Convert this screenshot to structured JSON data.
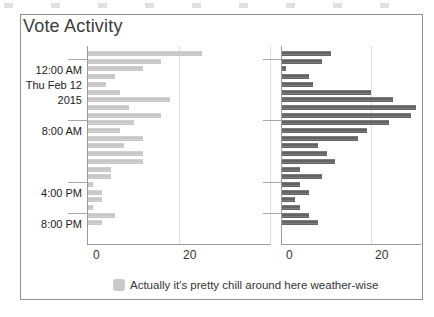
{
  "panel": {
    "title": "Vote Activity"
  },
  "chart_data": {
    "type": "bar",
    "orientation": "horizontal",
    "title": "Vote Activity",
    "xlabel": "",
    "ylabel": "Time (hourly bins, Thu Feb 12 2015)",
    "x_tick_labels": [
      "0",
      "20"
    ],
    "grid": "vertical gridline at x=20 in each facet",
    "legend_position": "bottom",
    "xlim_left_facet": [
      0,
      40
    ],
    "xlim_right_facet": [
      0,
      31
    ],
    "categories": [
      "11 PM (Wed Feb 11)",
      "12 AM",
      "1 AM",
      "2 AM",
      "3 AM",
      "4 AM",
      "5 AM",
      "6 AM",
      "7 AM",
      "8 AM",
      "9 AM",
      "10 AM",
      "11 AM",
      "12 PM",
      "1 PM",
      "2 PM",
      "3 PM",
      "4 PM",
      "5 PM",
      "6 PM",
      "7 PM",
      "8 PM",
      "9 PM"
    ],
    "series": [
      {
        "name": "Actually it's pretty chill around here weather-wise",
        "facet": "left",
        "color": "#c9c9c9",
        "values": [
          25,
          16,
          12,
          6,
          4,
          7,
          18,
          9,
          16,
          10,
          7,
          12,
          8,
          12,
          12,
          5,
          5,
          1,
          3,
          3,
          1,
          6,
          3
        ]
      },
      {
        "name": "",
        "facet": "right",
        "color": "#6b6b6b",
        "values": [
          11,
          9,
          1,
          6,
          7,
          20,
          25,
          30,
          29,
          24,
          19,
          17,
          8,
          10,
          12,
          4,
          9,
          4,
          6,
          3,
          4,
          6,
          8
        ]
      }
    ],
    "y_axis_ticks": [
      {
        "row": 1,
        "lines": [
          "12:00 AM",
          "Thu Feb 12",
          "2015"
        ]
      },
      {
        "row": 9,
        "lines": [
          "8:00 AM"
        ]
      },
      {
        "row": 17,
        "lines": [
          "4:00 PM"
        ]
      },
      {
        "row": 21,
        "lines": [
          "8:00 PM"
        ]
      }
    ],
    "legend": {
      "entries": [
        {
          "label": "Actually it's pretty chill around here weather-wise",
          "swatch_color": "#c9c9c9"
        }
      ]
    }
  }
}
